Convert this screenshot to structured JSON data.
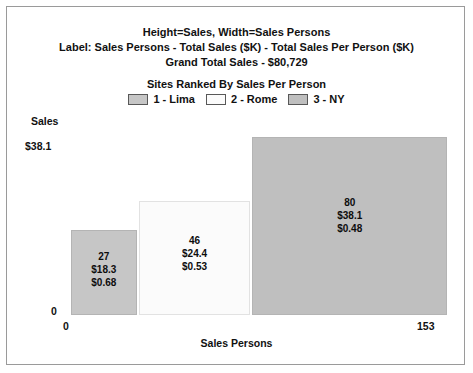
{
  "header": {
    "line1": "Height=Sales, Width=Sales Persons",
    "line2": "Label: Sales Persons - Total Sales ($K) - Total Sales Per Person  ($K)",
    "line3": "Grand Total Sales - $80,729"
  },
  "subtitle": "Sites Ranked By Sales Per Person",
  "legend": {
    "items": [
      {
        "label": "1 - Lima",
        "color": "#c6c6c6"
      },
      {
        "label": "2 - Rome",
        "color": "#fbfbfb"
      },
      {
        "label": "3 - NY",
        "color": "#bfbfbf"
      }
    ]
  },
  "axes": {
    "y_title": "Sales",
    "y_max_label": "$38.1",
    "y_min_label": "0",
    "x_title": "Sales Persons",
    "x_min_label": "0",
    "x_max_label": "153"
  },
  "chart_data": {
    "type": "bar",
    "variant": "variable-width-marimekko",
    "title": "Height=Sales, Width=Sales Persons",
    "subtitle": "Sites Ranked By Sales Per Person",
    "xlabel": "Sales Persons",
    "ylabel": "Sales",
    "xlim": [
      0,
      153
    ],
    "ylim": [
      0,
      38.1
    ],
    "grid": false,
    "legend_position": "top",
    "annotations": [
      "Label: Sales Persons - Total Sales ($K) - Total Sales Per Person  ($K)",
      "Grand Total Sales - $80,729"
    ],
    "categories": [
      "1 - Lima",
      "2 - Rome",
      "3 - NY"
    ],
    "series": [
      {
        "name": "Sales Persons (width)",
        "values": [
          27,
          46,
          80
        ]
      },
      {
        "name": "Total Sales ($K) (height)",
        "values": [
          18.3,
          24.4,
          38.1
        ]
      },
      {
        "name": "Total Sales Per Person ($K)",
        "values": [
          0.68,
          0.53,
          0.48
        ]
      }
    ],
    "bars": [
      {
        "rank": "1 - Lima",
        "sales_persons": 27,
        "total_sales_k": 18.3,
        "sales_per_person_k": 0.48,
        "color": "#c6c6c6",
        "label_lines": [
          "27",
          "$18.3",
          "$0.68"
        ]
      },
      {
        "rank": "2 - Rome",
        "sales_persons": 46,
        "total_sales_k": 24.4,
        "sales_per_person_k": 0.53,
        "color": "#fbfbfb",
        "label_lines": [
          "46",
          "$24.4",
          "$0.53"
        ]
      },
      {
        "rank": "3 - NY",
        "sales_persons": 80,
        "total_sales_k": 38.1,
        "sales_per_person_k": 0.48,
        "color": "#bfbfbf",
        "label_lines": [
          "80",
          "$38.1",
          "$0.48"
        ]
      }
    ]
  }
}
